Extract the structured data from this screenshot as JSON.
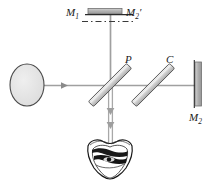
{
  "figure": {
    "type": "optics-ray-diagram",
    "width": 215,
    "height": 184,
    "background_color": "#ffffff"
  },
  "labels": {
    "mirror1": {
      "text": "M",
      "subscript": "1",
      "prime": ""
    },
    "mirror2_virtual": {
      "text": "M",
      "subscript": "2",
      "prime": "′"
    },
    "mirror2": {
      "text": "M",
      "subscript": "2",
      "prime": ""
    },
    "beamsplitter": {
      "text": "P"
    },
    "compensator": {
      "text": "C"
    }
  },
  "components": {
    "source": {
      "name": "extended-light-source",
      "shape": "ellipse",
      "cx": 27,
      "cy": 85,
      "rx": 17,
      "ry": 21,
      "fill": "#e2e2e2",
      "stroke": "#3a3a3a"
    },
    "mirror_m1": {
      "name": "mirror-m1",
      "shape": "horizontal-bar",
      "x": 88,
      "y": 9,
      "width": 34,
      "height": 5,
      "fill": "#b8b8b8",
      "stroke": "#6a6a6a"
    },
    "mirror_m2": {
      "name": "mirror-m2",
      "shape": "vertical-bar",
      "x": 195,
      "y": 62,
      "width": 6,
      "height": 44,
      "fill": "#b5b5b5",
      "stroke": "#6a6a6a"
    },
    "beamsplitter_p": {
      "name": "beamsplitter-plate",
      "shape": "tilted-plate",
      "angle_deg": -45,
      "cx": 110,
      "cy": 85,
      "length": 52,
      "thickness": 7,
      "fill": "#dcdcdc",
      "stroke": "#555555"
    },
    "compensator_c": {
      "name": "compensator-plate",
      "shape": "tilted-plate",
      "angle_deg": -45,
      "cx": 153,
      "cy": 85,
      "length": 52,
      "thickness": 7,
      "fill": "#dcdcdc",
      "stroke": "#555555"
    },
    "virtual_mirror_line": {
      "name": "virtual-image-dash-dot-line",
      "y": 21,
      "x1": 83,
      "x2": 130,
      "pattern": "dash-dot",
      "stroke": "#3a3a3a"
    },
    "eye": {
      "name": "observer-eye",
      "cx": 110,
      "cy": 160,
      "stroke": "#1a1a1a"
    }
  },
  "beams": {
    "stroke_color": "#9a9a9a",
    "stroke_width": 1.6,
    "paths": [
      {
        "name": "source-to-beamsplitter",
        "x1": 44,
        "y1": 85,
        "x2": 110,
        "y2": 85
      },
      {
        "name": "beamsplitter-to-m2",
        "x1": 110,
        "y1": 85,
        "x2": 195,
        "y2": 85
      },
      {
        "name": "beamsplitter-to-m1",
        "x1": 110,
        "y1": 85,
        "x2": 110,
        "y2": 12
      },
      {
        "name": "beamsplitter-to-eye",
        "x1": 110,
        "y1": 85,
        "x2": 110,
        "y2": 145
      }
    ],
    "arrows": [
      {
        "name": "arrow-incident-beam",
        "x": 64,
        "y": 85,
        "direction": "right"
      },
      {
        "name": "arrow-output-beam-upper",
        "x": 110,
        "y": 112,
        "direction": "down"
      },
      {
        "name": "arrow-output-beam-lower",
        "x": 110,
        "y": 126,
        "direction": "down"
      }
    ]
  },
  "label_positions": {
    "m1": {
      "x": 68,
      "y": 15
    },
    "m2_prime": {
      "x": 128,
      "y": 15
    },
    "p": {
      "x": 126,
      "y": 62
    },
    "c": {
      "x": 167,
      "y": 62
    },
    "m2": {
      "x": 190,
      "y": 120
    }
  }
}
